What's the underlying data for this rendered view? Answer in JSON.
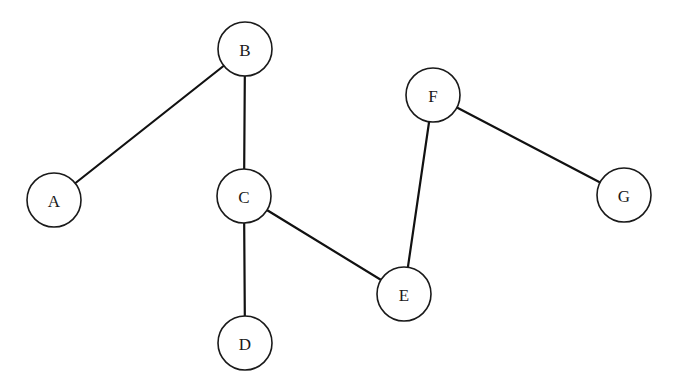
{
  "diagram": {
    "type": "undirected-graph",
    "style": {
      "background": "#ffffff",
      "stroke": "#1a1a1a",
      "node_fill": "#ffffff",
      "node_radius": 27
    },
    "nodes": [
      {
        "id": "A",
        "label": "A",
        "x": 54,
        "y": 200
      },
      {
        "id": "B",
        "label": "B",
        "x": 245,
        "y": 49
      },
      {
        "id": "C",
        "label": "C",
        "x": 244,
        "y": 196
      },
      {
        "id": "D",
        "label": "D",
        "x": 245,
        "y": 343
      },
      {
        "id": "E",
        "label": "E",
        "x": 404,
        "y": 294
      },
      {
        "id": "F",
        "label": "F",
        "x": 433,
        "y": 95
      },
      {
        "id": "G",
        "label": "G",
        "x": 624,
        "y": 195
      }
    ],
    "edges": [
      {
        "from": "B",
        "to": "A"
      },
      {
        "from": "B",
        "to": "C"
      },
      {
        "from": "C",
        "to": "D"
      },
      {
        "from": "C",
        "to": "E"
      },
      {
        "from": "E",
        "to": "F"
      },
      {
        "from": "F",
        "to": "G"
      }
    ]
  }
}
